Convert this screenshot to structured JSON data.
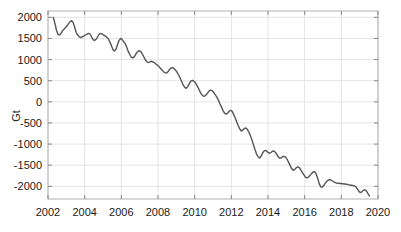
{
  "chart_data": {
    "type": "line",
    "title": "",
    "subtitle": "",
    "xlabel": "",
    "ylabel": "Gt",
    "xlim": [
      2002,
      2020
    ],
    "ylim": [
      -2300,
      2150
    ],
    "grid": true,
    "legend": null,
    "legend_position": "none",
    "line_color": "#555555",
    "grid_color": "#e4e4e4",
    "frame_color": "#b0b0b0",
    "background_color": "#ffffff",
    "xticks": [
      2002,
      2004,
      2006,
      2008,
      2010,
      2012,
      2014,
      2016,
      2018,
      2020
    ],
    "xtick_labels": [
      "2002",
      "2004",
      "2006",
      "2008",
      "2010",
      "2012",
      "2014",
      "2016",
      "2018",
      "2020"
    ],
    "yticks": [
      2000,
      1500,
      1000,
      500,
      0,
      -500,
      -1000,
      -1500,
      -2000
    ],
    "ytick_labels": [
      "2000",
      "1500",
      "1000",
      "500",
      "0",
      "-500",
      "-1000",
      "-1500",
      "-2000"
    ],
    "series": [
      {
        "name": "mass anomaly",
        "x": [
          2002.29,
          2002.37,
          2002.46,
          2002.54,
          2002.62,
          2002.71,
          2002.79,
          2002.87,
          2002.96,
          2003.04,
          2003.12,
          2003.21,
          2003.29,
          2003.37,
          2003.46,
          2003.54,
          2003.62,
          2003.71,
          2003.79,
          2003.87,
          2003.96,
          2004.04,
          2004.12,
          2004.21,
          2004.29,
          2004.37,
          2004.46,
          2004.54,
          2004.62,
          2004.71,
          2004.79,
          2004.87,
          2004.96,
          2005.04,
          2005.12,
          2005.21,
          2005.29,
          2005.37,
          2005.46,
          2005.54,
          2005.62,
          2005.71,
          2005.79,
          2005.87,
          2005.96,
          2006.04,
          2006.12,
          2006.21,
          2006.29,
          2006.37,
          2006.46,
          2006.54,
          2006.62,
          2006.71,
          2006.79,
          2006.87,
          2006.96,
          2007.04,
          2007.12,
          2007.21,
          2007.29,
          2007.37,
          2007.46,
          2007.54,
          2007.62,
          2007.71,
          2007.79,
          2007.87,
          2007.96,
          2008.04,
          2008.12,
          2008.21,
          2008.29,
          2008.37,
          2008.46,
          2008.54,
          2008.62,
          2008.71,
          2008.79,
          2008.87,
          2008.96,
          2009.04,
          2009.12,
          2009.21,
          2009.29,
          2009.37,
          2009.46,
          2009.54,
          2009.62,
          2009.71,
          2009.79,
          2009.87,
          2009.96,
          2010.04,
          2010.12,
          2010.21,
          2010.29,
          2010.37,
          2010.46,
          2010.54,
          2010.62,
          2010.71,
          2010.79,
          2010.87,
          2010.96,
          2011.04,
          2011.12,
          2011.21,
          2011.29,
          2011.37,
          2011.46,
          2011.54,
          2011.62,
          2011.71,
          2011.79,
          2011.87,
          2011.96,
          2012.04,
          2012.12,
          2012.21,
          2012.29,
          2012.37,
          2012.46,
          2012.54,
          2012.62,
          2012.71,
          2012.79,
          2012.87,
          2012.96,
          2013.04,
          2013.12,
          2013.21,
          2013.29,
          2013.37,
          2013.46,
          2013.54,
          2013.62,
          2013.71,
          2013.79,
          2013.87,
          2013.96,
          2014.04,
          2014.12,
          2014.21,
          2014.29,
          2014.37,
          2014.46,
          2014.54,
          2014.62,
          2014.71,
          2014.79,
          2014.87,
          2014.96,
          2015.04,
          2015.12,
          2015.21,
          2015.29,
          2015.37,
          2015.46,
          2015.54,
          2015.62,
          2015.71,
          2015.79,
          2015.87,
          2015.96,
          2016.04,
          2016.12,
          2016.21,
          2016.29,
          2016.37,
          2016.46,
          2016.54,
          2016.62,
          2016.71,
          2016.79,
          2016.87,
          2016.96,
          2017.04,
          2017.12,
          2017.21,
          2017.29,
          2017.37,
          2017.46,
          2017.54,
          2017.62,
          2017.71,
          2018.29,
          2018.37,
          2018.46,
          2018.54,
          2018.62,
          2018.71,
          2018.79,
          2018.87,
          2018.96,
          2019.04,
          2019.12,
          2019.21,
          2019.29,
          2019.37,
          2019.46,
          2019.54
        ],
        "y": [
          2000,
          1870,
          1700,
          1600,
          1580,
          1620,
          1680,
          1720,
          1760,
          1800,
          1850,
          1900,
          1920,
          1880,
          1760,
          1640,
          1580,
          1540,
          1520,
          1540,
          1560,
          1580,
          1600,
          1620,
          1610,
          1540,
          1470,
          1450,
          1480,
          1540,
          1600,
          1620,
          1600,
          1580,
          1560,
          1530,
          1490,
          1420,
          1330,
          1240,
          1200,
          1250,
          1350,
          1450,
          1500,
          1480,
          1430,
          1380,
          1300,
          1200,
          1120,
          1060,
          1040,
          1070,
          1130,
          1180,
          1210,
          1200,
          1150,
          1080,
          1010,
          960,
          930,
          940,
          960,
          950,
          930,
          900,
          870,
          840,
          800,
          760,
          720,
          690,
          680,
          710,
          760,
          800,
          810,
          790,
          750,
          700,
          640,
          560,
          480,
          400,
          340,
          320,
          360,
          430,
          490,
          510,
          490,
          450,
          390,
          320,
          240,
          180,
          140,
          130,
          160,
          210,
          260,
          280,
          260,
          220,
          170,
          110,
          40,
          -40,
          -120,
          -200,
          -260,
          -290,
          -270,
          -230,
          -200,
          -220,
          -290,
          -380,
          -470,
          -560,
          -640,
          -690,
          -670,
          -630,
          -620,
          -650,
          -720,
          -800,
          -900,
          -1020,
          -1130,
          -1230,
          -1300,
          -1330,
          -1290,
          -1210,
          -1160,
          -1150,
          -1180,
          -1210,
          -1210,
          -1180,
          -1160,
          -1180,
          -1230,
          -1290,
          -1330,
          -1330,
          -1300,
          -1290,
          -1310,
          -1360,
          -1430,
          -1510,
          -1580,
          -1620,
          -1600,
          -1560,
          -1540,
          -1560,
          -1610,
          -1670,
          -1730,
          -1780,
          -1800,
          -1780,
          -1740,
          -1700,
          -1660,
          -1650,
          -1700,
          -1810,
          -1930,
          -2010,
          -2020,
          -1980,
          -1930,
          -1880,
          -1850,
          -1840,
          -1860,
          -1880,
          -1900,
          -1920,
          -1950,
          -1960,
          -1970,
          -1975,
          -1980,
          -1990,
          -2010,
          -2060,
          -2120,
          -2150,
          -2130,
          -2090,
          -2080,
          -2110,
          -2180,
          -2230
        ]
      }
    ]
  },
  "axes": {
    "y_axis_title": "Gt"
  }
}
